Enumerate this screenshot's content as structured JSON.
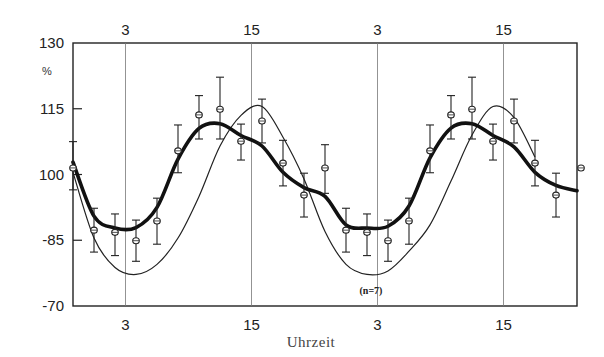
{
  "chart_data": {
    "type": "line",
    "title": "",
    "xlabel": "Uhrzeit",
    "ylabel": "%",
    "annotation": "(n=7)",
    "ylim": [
      70,
      130
    ],
    "y_ticks": [
      {
        "label": "130",
        "value": 130
      },
      {
        "label": "115",
        "value": 115
      },
      {
        "label": "100",
        "value": 100
      },
      {
        "label": "-85",
        "value": 85
      },
      {
        "label": "-70",
        "value": 70
      }
    ],
    "x_ticks_top": [
      "3",
      "15",
      "3",
      "15"
    ],
    "x_ticks_bottom": [
      "3",
      "15",
      "3",
      "15"
    ],
    "x_tick_hours": [
      3,
      15,
      27,
      39
    ],
    "grid": "vertical lines at tick hours",
    "x_hours": [
      -2,
      0,
      2,
      4,
      6,
      8,
      10,
      12,
      14,
      16,
      18,
      20,
      22,
      24,
      26,
      28,
      30,
      32,
      34,
      36,
      38,
      40,
      42,
      44,
      46
    ],
    "series": [
      {
        "name": "Messwerte (Mittelwert ± SD)",
        "style": "circle markers with error bars",
        "values": [
          101.5,
          87.3,
          86.8,
          84.9,
          89.4,
          105.4,
          113.6,
          114.9,
          107.6,
          112.2,
          102.6,
          95.3,
          101.5,
          87.3,
          86.8,
          84.9,
          89.4,
          105.4,
          113.6,
          114.9,
          107.6,
          112.2,
          102.6,
          95.3,
          101.5
        ],
        "err_upper": [
          107.5,
          92.3,
          91.0,
          89.6,
          94.6,
          111.3,
          118.0,
          122.2,
          111.5,
          117.2,
          107.8,
          100.3,
          106.8,
          92.3,
          91.0,
          89.6,
          94.6,
          111.3,
          118.0,
          122.2,
          111.5,
          117.2,
          107.8,
          100.3,
          106.8
        ],
        "err_lower": [
          96.5,
          82.3,
          81.5,
          80.2,
          84.1,
          100.4,
          108.1,
          108.1,
          103.3,
          107.2,
          97.4,
          90.3,
          95.7,
          82.3,
          81.5,
          80.2,
          84.1,
          100.4,
          108.1,
          108.1,
          103.3,
          107.2,
          97.4,
          90.3,
          95.7
        ]
      },
      {
        "name": "Ausgleichskurve (dick)",
        "style": "thick line",
        "values": [
          102.8,
          90.5,
          87.8,
          87.9,
          92.5,
          103.5,
          110.5,
          111.6,
          108.9,
          106.5,
          100.5,
          97.0,
          95.0,
          88.5,
          87.8,
          88.2,
          92.8,
          103.8,
          110.6,
          111.6,
          108.9,
          106.3,
          100.5,
          97.5,
          96.3
        ]
      },
      {
        "name": "Kurve (dünn)",
        "style": "thin line",
        "values": [
          100.5,
          85.5,
          78.8,
          77.2,
          79.5,
          85.5,
          95.0,
          106.5,
          113.5,
          115.5,
          108.5,
          99.0,
          87.0,
          79.5,
          77.2,
          78.0,
          82.5,
          88.5,
          98.5,
          109.0,
          115.5,
          113.0,
          104.0,
          0,
          0
        ]
      }
    ]
  }
}
